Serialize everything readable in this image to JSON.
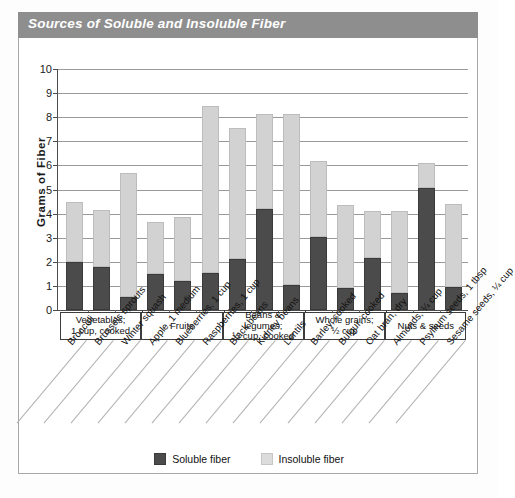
{
  "title": "Sources of Soluble and Insoluble Fiber",
  "legend": {
    "soluble_label": "Soluble fiber",
    "insoluble_label": "Insoluble fiber",
    "soluble_color": "#4b4b4b",
    "insoluble_color": "#d2d2d2"
  },
  "colors": {
    "title_bar": "#8e8e8e",
    "title_text": "#ffffff",
    "axis": "#4d4d4d",
    "gridline": "#9a9a9a",
    "card_border": "#a8a8a8"
  },
  "chart_data": {
    "type": "bar",
    "title": "Sources of Soluble and Insoluble Fiber",
    "xlabel": "",
    "ylabel": "Grams of Fiber",
    "ylim": [
      0,
      10
    ],
    "yticks": [
      0,
      1,
      2,
      3,
      4,
      5,
      6,
      7,
      8,
      9,
      10
    ],
    "grid": true,
    "stacked": true,
    "legend_position": "bottom-center",
    "categories": [
      "Broccoli",
      "Brussels sprouts",
      "Winter squash",
      "Apple, 1 medium",
      "Blueberries, 1 cup",
      "Raspberries, 1 cup",
      "Black beans",
      "Kidney beans",
      "Lentils",
      "Barley, cooked",
      "Bulgur, cooked",
      "Oat bran, dry",
      "Almonds, ¼ cup",
      "Psyllium seeds, 1 tbsp",
      "Sesame seeds, ¼ cup"
    ],
    "series": [
      {
        "name": "Soluble fiber",
        "color": "#4b4b4b",
        "values": [
          2.0,
          1.8,
          0.55,
          1.5,
          1.2,
          1.55,
          2.1,
          4.2,
          1.05,
          3.05,
          0.9,
          2.15,
          0.7,
          5.05,
          0.95
        ]
      },
      {
        "name": "Insoluble fiber",
        "color": "#d2d2d2",
        "values": [
          2.5,
          2.35,
          5.15,
          2.15,
          2.65,
          6.9,
          5.45,
          3.95,
          7.1,
          3.15,
          3.45,
          1.95,
          3.4,
          1.05,
          3.45
        ]
      }
    ],
    "totals": [
      4.5,
      4.15,
      5.7,
      3.65,
      3.85,
      8.45,
      7.55,
      8.15,
      8.15,
      6.2,
      4.35,
      4.1,
      4.1,
      6.1,
      4.4
    ],
    "groups": [
      {
        "label": "Vegetables;\n1 cup, cooked",
        "line1": "Vegetables;",
        "line2": "1 cup, cooked",
        "start": 0,
        "count": 3
      },
      {
        "label": "Fruits",
        "line1": "Fruits",
        "line2": "",
        "start": 3,
        "count": 3
      },
      {
        "label": "Beans & legumes;\n½ cup, cooked",
        "line1": "Beans & legumes;",
        "line2": "½ cup, cooked",
        "start": 6,
        "count": 3
      },
      {
        "label": "Whole grains;\n½ cup",
        "line1": "Whole grains;",
        "line2": "½ cup",
        "start": 9,
        "count": 3
      },
      {
        "label": "Nuts & seeds",
        "line1": "Nuts & seeds",
        "line2": "",
        "start": 12,
        "count": 3
      }
    ]
  }
}
